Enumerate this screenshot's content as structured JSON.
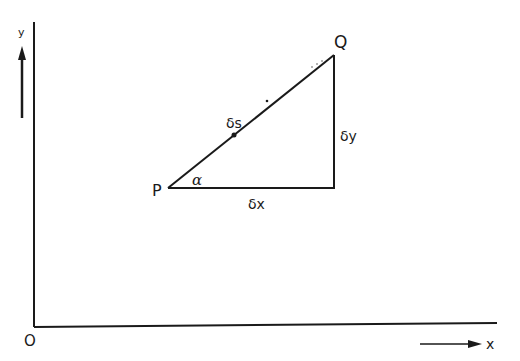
{
  "diagram": {
    "type": "geometry",
    "colors": {
      "ink": "#1a1a1a",
      "background": "#ffffff"
    },
    "axes": {
      "origin_label": "O",
      "x_label": "x",
      "y_label": "y"
    },
    "points": {
      "P": {
        "label": "P"
      },
      "Q": {
        "label": "Q"
      }
    },
    "labels": {
      "angle": "α",
      "horizontal_side": "δx",
      "vertical_side": "δy",
      "hypotenuse": "δs"
    }
  }
}
